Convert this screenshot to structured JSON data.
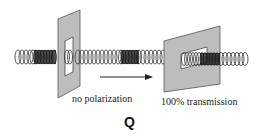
{
  "figure": {
    "left_caption": "no polarization",
    "right_caption": "100% transmission",
    "panel_label": "Q"
  },
  "colors": {
    "polarizer_fill": "#bdbdbd",
    "polarizer_stroke": "#555555",
    "slit_fill": "#ffffff",
    "coil_stroke": "#333333",
    "arrow": "#222222"
  },
  "elements": {
    "polarizer_1": "vertical-slit polarizer",
    "polarizer_2": "horizontal-slit polarizer",
    "wave": "helical coil wave",
    "arrow": "propagation arrow"
  }
}
